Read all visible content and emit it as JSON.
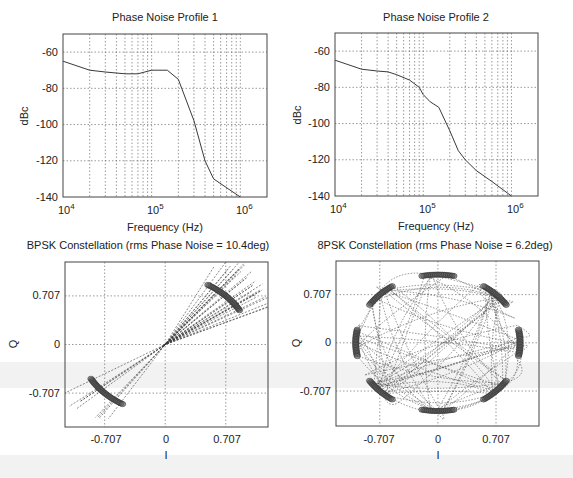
{
  "chart_data": [
    {
      "type": "line",
      "title": "Phase Noise Profile 1",
      "xlabel": "Frequency (Hz)",
      "ylabel": "dBc",
      "xscale": "log",
      "xlim": [
        10000,
        2000000
      ],
      "ylim": [
        -140,
        -50
      ],
      "xticks": [
        "10^4",
        "10^5",
        "10^6"
      ],
      "yticks": [
        -60,
        -80,
        -100,
        -120,
        -140
      ],
      "grid": true,
      "series": [
        {
          "name": "profile1",
          "x": [
            10000,
            20000,
            30000,
            50000,
            70000,
            100000,
            150000,
            200000,
            300000,
            400000,
            500000,
            1000000
          ],
          "y": [
            -65,
            -70,
            -71,
            -72,
            -72,
            -70,
            -70,
            -75,
            -98,
            -120,
            -130,
            -140
          ]
        }
      ]
    },
    {
      "type": "line",
      "title": "Phase Noise Profile 2",
      "xlabel": "Frequency (Hz)",
      "ylabel": "dBc",
      "xscale": "log",
      "xlim": [
        10000,
        2000000
      ],
      "ylim": [
        -140,
        -50
      ],
      "xticks": [
        "10^4",
        "10^5",
        "10^6"
      ],
      "yticks": [
        -60,
        -80,
        -100,
        -120,
        -140
      ],
      "grid": true,
      "series": [
        {
          "name": "profile2",
          "x": [
            10000,
            20000,
            30000,
            40000,
            50000,
            70000,
            90000,
            100000,
            120000,
            150000,
            200000,
            250000,
            300000,
            400000,
            600000,
            1000000
          ],
          "y": [
            -65,
            -70,
            -71,
            -71.5,
            -73,
            -76,
            -80,
            -84,
            -88,
            -91,
            -104,
            -115,
            -120,
            -126,
            -132,
            -140
          ]
        }
      ]
    },
    {
      "type": "scatter",
      "title": "BPSK Constellation (rms Phase Noise = 10.4deg)",
      "xlabel": "I",
      "ylabel": "Q",
      "xlim": [
        -1.17,
        1.2
      ],
      "ylim": [
        -1.2,
        1.2
      ],
      "xticks": [
        -0.707,
        0,
        0.707
      ],
      "yticks": [
        0.707,
        0,
        -0.707
      ],
      "grid": true,
      "symbol_points": [
        [
          0.707,
          0.707
        ],
        [
          -0.707,
          -0.707
        ]
      ],
      "rms_phase_noise_deg": 10.4
    },
    {
      "type": "scatter",
      "title": "8PSK Constellation (rms Phase Noise = 6.2deg)",
      "xlabel": "I",
      "ylabel": "Q",
      "xlim": [
        -1.24,
        1.23
      ],
      "ylim": [
        -1.22,
        1.2
      ],
      "xticks": [
        -0.707,
        0,
        0.707
      ],
      "yticks": [
        0.707,
        0,
        -0.707
      ],
      "grid": true,
      "symbol_points": [
        [
          1,
          0
        ],
        [
          0.707,
          0.707
        ],
        [
          0,
          1
        ],
        [
          -0.707,
          0.707
        ],
        [
          -1,
          0
        ],
        [
          -0.707,
          -0.707
        ],
        [
          0,
          -1
        ],
        [
          0.707,
          -0.707
        ]
      ],
      "rms_phase_noise_deg": 6.2
    }
  ],
  "plots": {
    "p1": {
      "title": "Phase Noise Profile 1",
      "xlabel": "Frequency (Hz)",
      "ylabel": "dBc"
    },
    "p2": {
      "title": "Phase Noise Profile 2",
      "xlabel": "Frequency (Hz)",
      "ylabel": "dBc"
    },
    "p3": {
      "title": "BPSK Constellation (rms Phase Noise = 10.4deg)",
      "xlabel": "I",
      "ylabel": "Q"
    },
    "p4": {
      "title": "8PSK Constellation (rms Phase Noise = 6.2deg)",
      "xlabel": "I",
      "ylabel": "Q"
    }
  },
  "ticks": {
    "db": [
      "-60",
      "-80",
      "-100",
      "-120",
      "-140"
    ],
    "decade_base": "10",
    "decade_exp": [
      "4",
      "5",
      "6"
    ],
    "iq": [
      "-0.707",
      "0",
      "0.707"
    ],
    "q": [
      "0.707",
      "0",
      "-0.707"
    ]
  },
  "colors": {
    "line": "#3a3a3a",
    "grid": "#555555",
    "axis": "#444444",
    "marker": "#5a5a5a"
  }
}
